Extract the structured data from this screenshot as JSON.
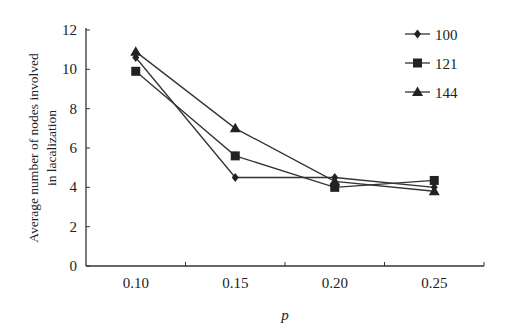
{
  "chart_data": {
    "type": "line",
    "title": "",
    "xlabel": "p",
    "ylabel": "Average number of nodes involved in lacalization",
    "ylabel_lines": [
      "Average number of nodes involved",
      "in lacalization"
    ],
    "categories": [
      "0.10",
      "0.15",
      "0.20",
      "0.25"
    ],
    "ylim": [
      0,
      12
    ],
    "yticks": [
      0,
      2,
      4,
      6,
      8,
      10,
      12
    ],
    "grid": false,
    "legend_position": "upper right",
    "series": [
      {
        "name": "100",
        "marker": "diamond",
        "values": [
          10.6,
          4.5,
          4.5,
          4.0
        ]
      },
      {
        "name": "121",
        "marker": "square",
        "values": [
          9.9,
          5.6,
          4.0,
          4.35
        ]
      },
      {
        "name": "144",
        "marker": "triangle",
        "values": [
          10.9,
          7.0,
          4.3,
          3.8
        ]
      }
    ]
  },
  "colors": {
    "line": "#333333",
    "axis": "#333333",
    "background": "#ffffff"
  }
}
